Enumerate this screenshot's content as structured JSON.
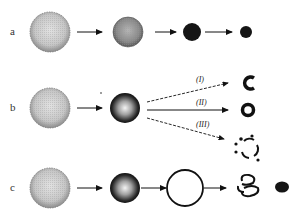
{
  "rows": [
    {
      "label": "a",
      "stages": [
        "large-textured-sphere",
        "medium-textured-sphere",
        "dark-sphere",
        "small-dark-sphere"
      ]
    },
    {
      "label": "b",
      "stages": [
        "large-textured-sphere",
        "shaded-sphere"
      ],
      "branches": [
        {
          "label": "(I)",
          "result": "c-shaped-fragment",
          "arrow_style": "dashed"
        },
        {
          "label": "(II)",
          "result": "ring",
          "arrow_style": "solid"
        },
        {
          "label": "(III)",
          "result": "broken-ring-with-dots",
          "arrow_style": "dashed"
        }
      ]
    },
    {
      "label": "c",
      "stages": [
        "large-textured-sphere",
        "shaded-sphere",
        "hollow-ring",
        "tangled-fragments",
        "dark-blob"
      ]
    }
  ],
  "colors": {
    "stroke": "#111111",
    "sphere_light": "#d8d8d8",
    "sphere_mid": "#9a9a9a",
    "dark": "#151515"
  }
}
